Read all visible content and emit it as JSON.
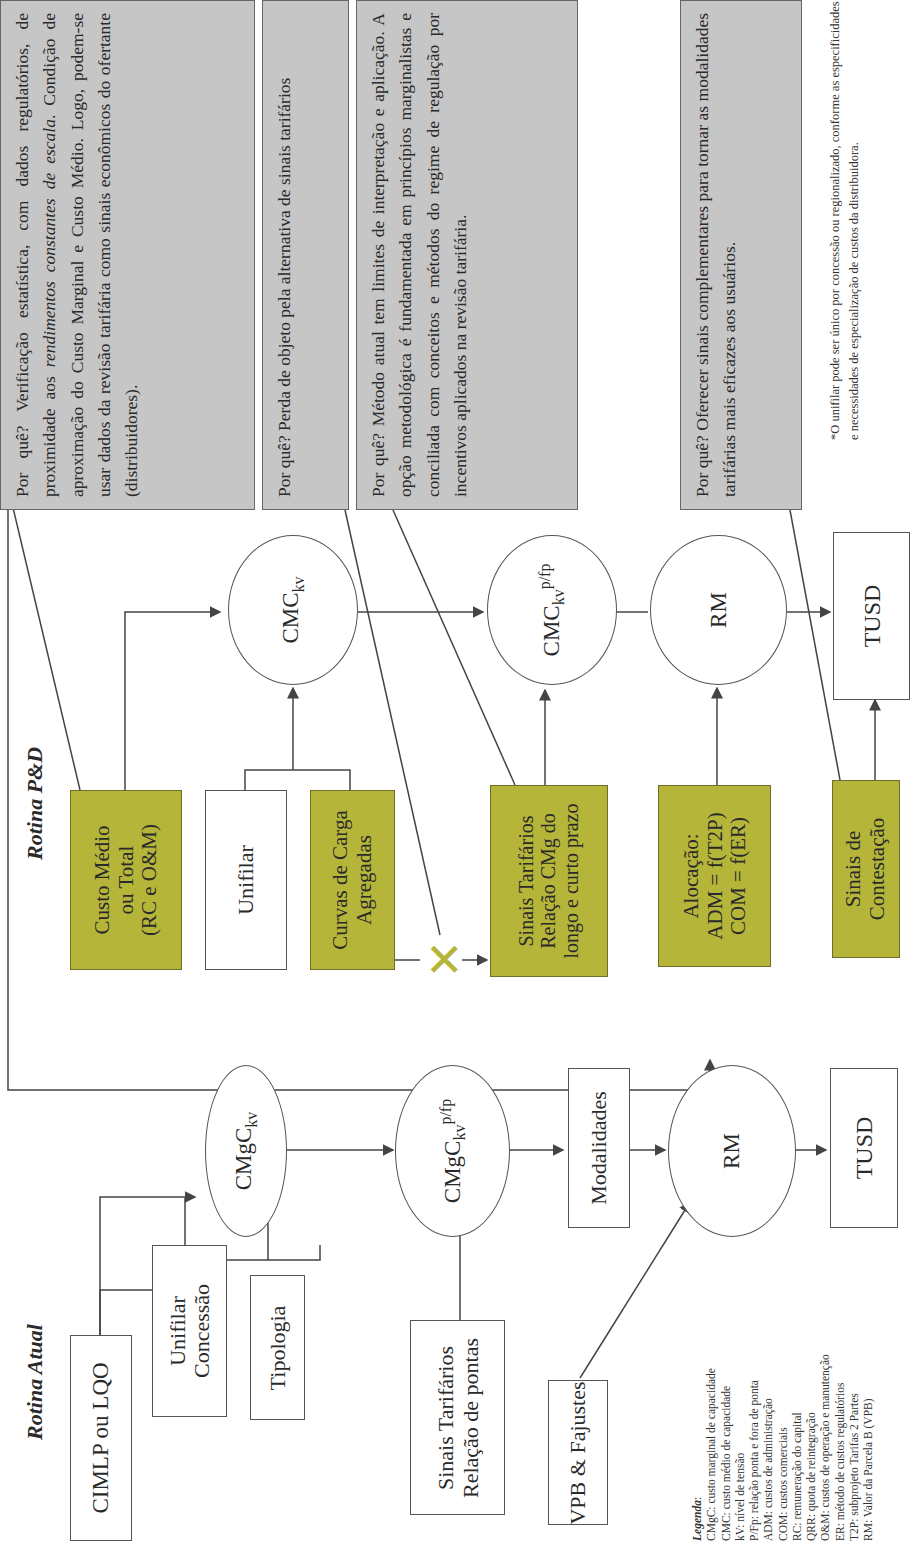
{
  "colors": {
    "olive_box": "#b5b53a",
    "gray_box": "#c6c6c6",
    "line": "#444444",
    "x_mark": "#b5b53a"
  },
  "rotina_atual": {
    "title": "Rotina Atual",
    "inputs": {
      "cimlp": "CIMLP ou LQO",
      "unifilar": [
        "Unifilar",
        "Concessão"
      ],
      "tipologia": "Tipologia",
      "sinais": [
        "Sinais Tarifários",
        "Relação de pontas"
      ],
      "vpb": "VPB & Fajustes"
    },
    "flow": {
      "cmgc_kv": {
        "base": "CMgC",
        "sub": "kv"
      },
      "cmgc_kv_pfp": {
        "base": "CMgC",
        "sub": "kv",
        "sup": "p/fp"
      },
      "modalidades": "Modalidades",
      "rm": "RM",
      "tusd": "TUSD"
    }
  },
  "rotina_pd": {
    "title": "Rotina P&D",
    "inputs": {
      "custo_medio": [
        "Custo Médio",
        "ou Total",
        "(RC e O&M)"
      ],
      "unifilar": "Unifilar",
      "curvas": [
        "Curvas de Carga",
        "Agregadas"
      ],
      "x_mark": "✕",
      "sinais": [
        "Sinais Tarifários",
        "Relação CMg do",
        "longo e curto prazo"
      ],
      "alocacao": [
        "Alocação:",
        "ADM = f(T2P)",
        "COM = f(ER)"
      ],
      "contestacao": [
        "Sinais de",
        "Contestação"
      ]
    },
    "flow": {
      "cmc_kv": {
        "base": "CMC",
        "sub": "kv"
      },
      "cmc_kv_pfp": {
        "base": "CMC",
        "sub": "kv",
        "sup": "p/fp"
      },
      "rm": "RM",
      "tusd": "TUSD"
    }
  },
  "explanations": [
    {
      "id": "custo-medio",
      "prefix": "Por quê? Verificação estatística, com dados regulatórios, de proximidade aos ",
      "italic": "rendimentos constantes de escala",
      "suffix": ". Condição de aproximação do Custo Marginal e Custo Médio. Logo, podem-se usar dados da revisão tarifária como sinais econômicos do ofertante (distribuidores)."
    },
    {
      "id": "perda-objeto",
      "text": "Por quê? Perda de objeto pela alternativa de sinais tarifários"
    },
    {
      "id": "metodo-atual",
      "text": "Por quê? Método atual tem limites de interpretação e aplicação. A opção metodológica é fundamentada em princípios marginalistas e conciliada com conceitos e métodos do regime de regulação por incentivos aplicados na revisão tarifária."
    },
    {
      "id": "sinais-complementares",
      "text": "Por quê? Oferecer sinais complementares para tornar as modalidades tarifárias mais eficazes aos usuários."
    }
  ],
  "footnote": "*O unifilar pode ser único por concessão ou regionalizado, conforme as especificidades e necessidades de especialização de custos da distribuidora.",
  "legend": {
    "heading": "Legenda",
    "items": [
      "CMgC: custo marginal de capacidade",
      "CMC: custo médio de capacidade",
      "kV: nível de tensão",
      "P/Fp: relação ponta e fora de ponta",
      "ADM: custos de administração",
      "COM: custos comerciais",
      "RC: remuneração do capital",
      "QRR: quota de reintegração",
      "O&M: custos de operação e manutenção",
      "ER: método de custos regulatórios",
      "T2P: subprojeto Tarifas 2 Partes",
      "RM: Valor da Parcela B (VPB)"
    ]
  }
}
